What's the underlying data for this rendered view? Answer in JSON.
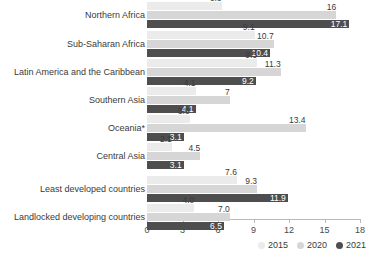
{
  "chart_data": {
    "type": "bar",
    "orientation": "horizontal",
    "title": "",
    "xlabel": "",
    "ylabel": "",
    "xlim": [
      0,
      18
    ],
    "xticks": [
      0,
      3,
      6,
      9,
      12,
      15,
      18
    ],
    "grid": false,
    "legend_position": "bottom-right",
    "categories": [
      "Northern Africa",
      "Sub-Saharan Africa",
      "Latin America and the Caribbean",
      "Southern Asia",
      "Oceania*",
      "Central Asia",
      "Least developed countries",
      "Landlocked developing countries"
    ],
    "series": [
      {
        "name": "2015",
        "color": "#ebebeb",
        "values": [
          6.3,
          9.1,
          9.3,
          4.1,
          3.6,
          2.1,
          7.6,
          4.0
        ]
      },
      {
        "name": "2020",
        "color": "#d6d6d6",
        "values": [
          16,
          10.7,
          11.3,
          7,
          13.4,
          4.5,
          9.3,
          7.0
        ]
      },
      {
        "name": "2021",
        "color": "#4e4e4e",
        "values": [
          17.1,
          10.4,
          9.2,
          4.1,
          3.1,
          3.1,
          11.9,
          6.5
        ]
      }
    ],
    "value_labels": [
      [
        "6.3",
        "16",
        "17.1"
      ],
      [
        "9.1",
        "10.7",
        "10.4"
      ],
      [
        "9.3",
        "11.3",
        "9.2"
      ],
      [
        "4.1",
        "7",
        "4.1"
      ],
      [
        "3.6",
        "13.4",
        "3.1"
      ],
      [
        "2.1",
        "4.5",
        "3.1"
      ],
      [
        "7.6",
        "9.3",
        "11.9"
      ],
      [
        "4.0",
        "7.0",
        "6.5"
      ]
    ]
  },
  "legend": {
    "items": [
      {
        "label": "2015",
        "color": "#ebebeb"
      },
      {
        "label": "2020",
        "color": "#d6d6d6"
      },
      {
        "label": "2021",
        "color": "#4e4e4e"
      }
    ]
  },
  "axis": {
    "tick_labels": [
      "0",
      "3",
      "6",
      "9",
      "12",
      "15",
      "18"
    ]
  }
}
